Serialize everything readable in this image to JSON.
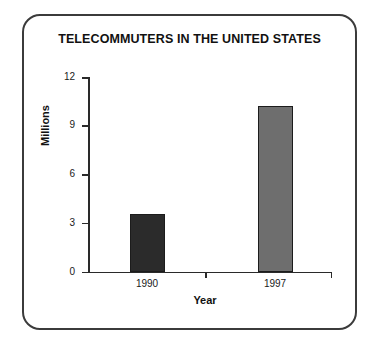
{
  "figure": {
    "border_color": "#3b3b3b",
    "background": "#ffffff"
  },
  "chart_data": {
    "type": "bar",
    "title": "TELECOMMUTERS IN THE UNITED STATES",
    "xlabel": "Year",
    "ylabel": "Millions",
    "categories": [
      "1990",
      "1997"
    ],
    "values": [
      3.6,
      10.2
    ],
    "ylim": [
      0,
      12
    ],
    "yticks": [
      0,
      3,
      6,
      9,
      12
    ],
    "ytick_labels": [
      "0",
      "3",
      "6",
      "9",
      "12"
    ],
    "grid": false,
    "legend": null,
    "bar_colors": [
      "#2b2b2b",
      "#6e6e6e"
    ],
    "bar_edge_color": "#1c1c1c",
    "series": [
      {
        "name": "Telecommuters",
        "points": [
          {
            "category": "1990",
            "value": 3.6,
            "color": "#2b2b2b"
          },
          {
            "category": "1997",
            "value": 10.2,
            "color": "#6e6e6e"
          }
        ]
      }
    ]
  }
}
